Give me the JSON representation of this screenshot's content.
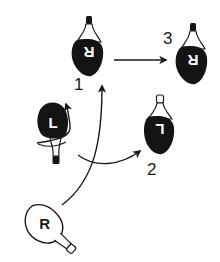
{
  "diagram": {
    "type": "footwork-sequence",
    "colors": {
      "ink": "#1a1a1a",
      "background": "#ffffff",
      "fill_dark": "#141414",
      "fill_light": "#ffffff"
    },
    "feet": [
      {
        "id": "start-right",
        "letter": "R",
        "style": "outline",
        "step": null
      },
      {
        "id": "left-pivot",
        "letter": "L",
        "style": "filled",
        "step": null,
        "annotation": "rotation arrow"
      },
      {
        "id": "step-1-right",
        "letter": "R",
        "style": "filled",
        "step": "1"
      },
      {
        "id": "step-2-left",
        "letter": "L",
        "style": "filled",
        "step": "2"
      },
      {
        "id": "step-3-right",
        "letter": "R",
        "style": "filled",
        "step": "3"
      }
    ],
    "labels": {
      "step1": "1",
      "step2": "2",
      "step3": "3"
    },
    "arrows": [
      {
        "from": "start-right",
        "to": "step-1-right",
        "shape": "curved"
      },
      {
        "from": "left-pivot",
        "to": "step-2-left",
        "shape": "curved"
      },
      {
        "from": "step-1-right",
        "to": "step-3-right",
        "shape": "straight"
      },
      {
        "from": "left-pivot",
        "to": "left-pivot",
        "shape": "rotation"
      }
    ]
  }
}
